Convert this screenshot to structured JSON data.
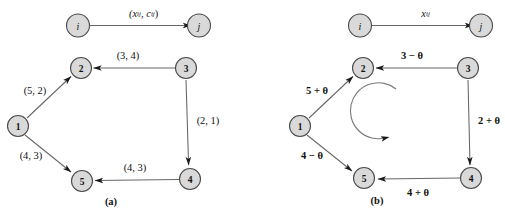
{
  "figure": {
    "background_color": "#ffffff",
    "node_fill_color": "#d9d9d9",
    "node_stroke_color": "#4a4a4a",
    "edge_color": "#666666",
    "text_color": "#101010"
  },
  "panels": [
    {
      "id": "panel-a",
      "caption": "(a)",
      "legend": {
        "from_node": "i",
        "to_node": "j",
        "label": "(xᵢⱼ, cᵢⱼ)",
        "label_parts": {
          "open": "(",
          "x_symbol": "x",
          "x_sub": "ij",
          "comma": ", ",
          "c_symbol": "c",
          "c_sub": "ij",
          "close": ")"
        }
      },
      "nodes": [
        {
          "id": "1",
          "label": "1"
        },
        {
          "id": "2",
          "label": "2"
        },
        {
          "id": "3",
          "label": "3"
        },
        {
          "id": "4",
          "label": "4"
        },
        {
          "id": "5",
          "label": "5"
        }
      ],
      "edges": [
        {
          "from": "1",
          "to": "2",
          "label": "(5, 2)"
        },
        {
          "from": "3",
          "to": "2",
          "label": "(3, 4)"
        },
        {
          "from": "3",
          "to": "4",
          "label": "(2, 1)"
        },
        {
          "from": "4",
          "to": "5",
          "label": "(4, 3)"
        },
        {
          "from": "1",
          "to": "5",
          "label": "(4, 3)"
        }
      ]
    },
    {
      "id": "panel-b",
      "caption": "(b)",
      "legend": {
        "from_node": "i",
        "to_node": "j",
        "label": "xᵢⱼ",
        "label_parts": {
          "x_symbol": "x",
          "x_sub": "ij"
        }
      },
      "nodes": [
        {
          "id": "1",
          "label": "1"
        },
        {
          "id": "2",
          "label": "2"
        },
        {
          "id": "3",
          "label": "3"
        },
        {
          "id": "4",
          "label": "4"
        },
        {
          "id": "5",
          "label": "5"
        }
      ],
      "edges": [
        {
          "from": "1",
          "to": "2",
          "label": "5 + θ"
        },
        {
          "from": "3",
          "to": "2",
          "label": "3 − θ"
        },
        {
          "from": "3",
          "to": "4",
          "label": "2 + θ"
        },
        {
          "from": "4",
          "to": "5",
          "label": "4 + θ"
        },
        {
          "from": "1",
          "to": "5",
          "label": "4 − θ"
        }
      ],
      "cycle_indicator": {
        "name": "counterclockwise-cycle-arrow",
        "direction": "counterclockwise"
      }
    }
  ]
}
